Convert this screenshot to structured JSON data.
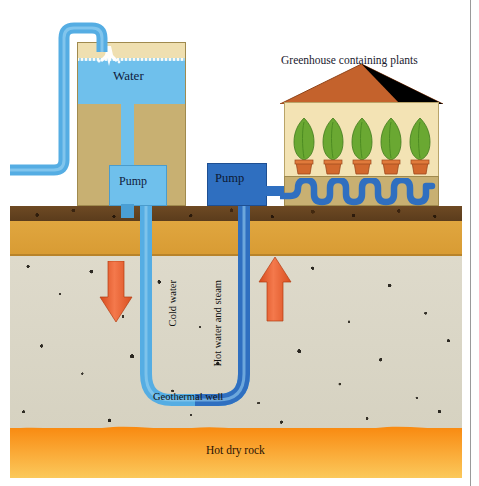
{
  "diagram": {
    "labels": {
      "greenhouse": "Greenhouse containing plants",
      "water": "Water",
      "pump_tank": "Pump",
      "pump_well": "Pump",
      "cold_water": "Cold water",
      "hot_water_and_steam": "Hot water and steam",
      "geothermal_well": "Geothermal well",
      "hot_dry_rock": "Hot dry rock"
    },
    "layers": [
      {
        "name": "topsoil",
        "color": "#5b3c1c"
      },
      {
        "name": "subsoil",
        "color": "#d89b33"
      },
      {
        "name": "bedrock",
        "color": "#d9d5c4"
      },
      {
        "name": "hot-dry-rock",
        "color": "#f98b12"
      }
    ],
    "colors": {
      "water_blue": "#6fc0ec",
      "pipe_light_blue": "#55ade3",
      "pipe_dark_blue": "#2f6fc0",
      "arrow_orange": "#e8582a",
      "roof_terracotta": "#c4622c",
      "greenhouse_wall": "#f3e3b4",
      "tank_body": "#c8b072",
      "plant_green": "#6aa832",
      "pot_terracotta": "#d2692e"
    },
    "flow": {
      "down_arrow": "cold water injected downward",
      "up_arrow": "hot water and steam rising"
    },
    "greenhouse": {
      "plant_count": 5,
      "pipe_loops": 4
    }
  }
}
